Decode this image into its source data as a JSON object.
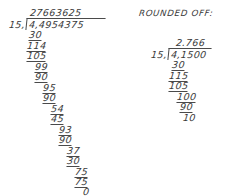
{
  "page": {
    "kind": "handwritten-long-division-worksheet",
    "ink_color": "#3a3a3a",
    "paper_color": "#ffffff"
  },
  "left_problem": {
    "name": "full-long-division",
    "quotient": "27663625",
    "divisor": "15,",
    "dividend": "4,4954375",
    "steps": [
      {
        "value": "30",
        "underlined": true
      },
      {
        "value": "114",
        "underlined": true
      },
      {
        "value": "105",
        "underlined": true
      },
      {
        "value": "99",
        "underlined": true
      },
      {
        "value": "90",
        "underlined": true
      },
      {
        "value": "95",
        "underlined": true
      },
      {
        "value": "90",
        "underlined": true
      },
      {
        "value": "54",
        "underlined": true
      },
      {
        "value": "45",
        "underlined": true
      },
      {
        "value": "93",
        "underlined": true
      },
      {
        "value": "90",
        "underlined": true
      },
      {
        "value": "37",
        "underlined": true
      },
      {
        "value": "30",
        "underlined": true
      },
      {
        "value": "75",
        "underlined": true
      },
      {
        "value": "75",
        "underlined": true
      },
      {
        "value": "0",
        "underlined": false
      }
    ]
  },
  "right_problem": {
    "name": "rounded-off-division",
    "heading": "ROUNDED OFF:",
    "quotient": "2.766",
    "divisor": "15,",
    "dividend": "4,1500",
    "steps": [
      {
        "value": "30",
        "underlined": true
      },
      {
        "value": "115",
        "underlined": true
      },
      {
        "value": "105",
        "underlined": true
      },
      {
        "value": "100",
        "underlined": true
      },
      {
        "value": "90",
        "underlined": true
      },
      {
        "value": "10",
        "underlined": false
      }
    ]
  }
}
